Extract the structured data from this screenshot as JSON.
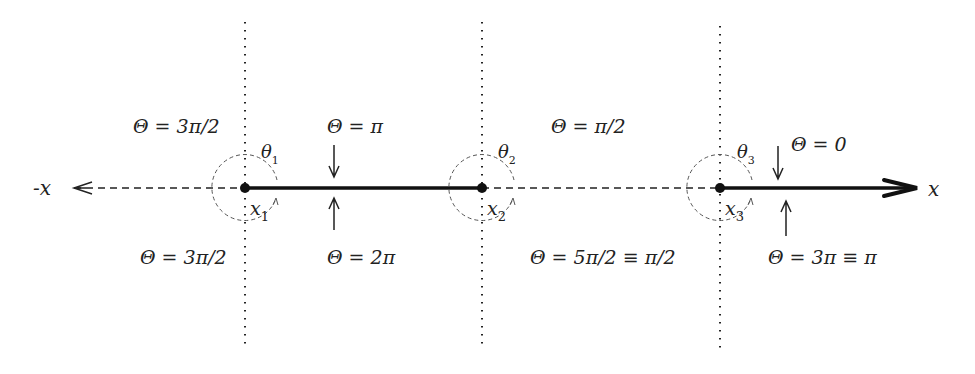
{
  "diagram": {
    "axis": {
      "neg_label": "-x",
      "pos_label": "x"
    },
    "points": [
      {
        "label": "x",
        "sub": "1",
        "theta": "θ",
        "theta_sub": "1"
      },
      {
        "label": "x",
        "sub": "2",
        "theta": "θ",
        "theta_sub": "2"
      },
      {
        "label": "x",
        "sub": "3",
        "theta": "θ",
        "theta_sub": "3"
      }
    ],
    "regions": {
      "left_upper": "Θ = 3π/2",
      "left_lower": "Θ = 3π/2",
      "mid1_upper": "Θ = π",
      "mid1_lower": "Θ = 2π",
      "mid2_upper": "Θ = π/2",
      "mid2_lower": "Θ = 5π/2 ≡ π/2",
      "right_upper": "Θ = 0",
      "right_lower": "Θ = 3π ≡ π"
    },
    "colors": {
      "ink": "#222222",
      "circle": "#555555",
      "background": "#ffffff"
    }
  }
}
